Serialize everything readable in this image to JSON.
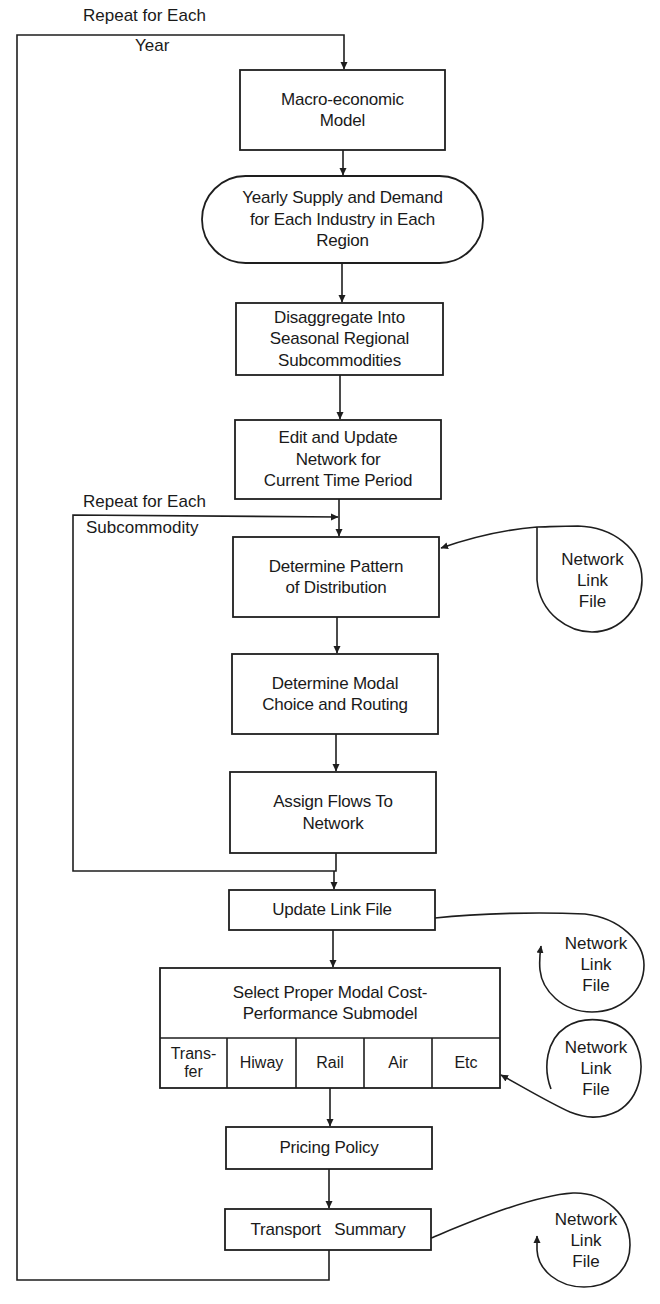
{
  "diagram": {
    "type": "flowchart",
    "loops": {
      "outer": {
        "line1": "Repeat for Each",
        "line2": "Year"
      },
      "inner": {
        "line1": "Repeat for Each",
        "line2": "Subcommodity"
      }
    },
    "nodes": [
      {
        "id": "macro_model",
        "shape": "process",
        "lines": [
          "Macro-economic",
          "Model"
        ]
      },
      {
        "id": "supply_demand",
        "shape": "terminal",
        "lines": [
          "Yearly Supply and Demand",
          "for Each Industry in Each",
          "Region"
        ]
      },
      {
        "id": "disaggregate",
        "shape": "process",
        "lines": [
          "Disaggregate Into",
          "Seasonal Regional",
          "Subcommodities"
        ]
      },
      {
        "id": "edit_network",
        "shape": "process",
        "lines": [
          "Edit and Update",
          "Network for",
          "Current Time Period"
        ]
      },
      {
        "id": "distribution_pattern",
        "shape": "process",
        "lines": [
          "Determine Pattern",
          "of Distribution"
        ]
      },
      {
        "id": "modal_choice",
        "shape": "process",
        "lines": [
          "Determine Modal",
          "Choice and Routing"
        ]
      },
      {
        "id": "assign_flows",
        "shape": "process",
        "lines": [
          "Assign Flows To",
          "Network"
        ]
      },
      {
        "id": "update_link_file",
        "shape": "process",
        "lines": [
          "Update Link File"
        ]
      },
      {
        "id": "select_submodel",
        "shape": "process",
        "lines": [
          "Select Proper Modal Cost-",
          "Performance Submodel"
        ],
        "cells": [
          {
            "lines": [
              "Trans-",
              "fer"
            ]
          },
          {
            "lines": [
              "Hiway"
            ]
          },
          {
            "lines": [
              "Rail"
            ]
          },
          {
            "lines": [
              "Air"
            ]
          },
          {
            "lines": [
              "Etc"
            ]
          }
        ]
      },
      {
        "id": "pricing_policy",
        "shape": "process",
        "lines": [
          "Pricing Policy"
        ]
      },
      {
        "id": "transport_summary",
        "shape": "process",
        "lines": [
          "Transport   Summary"
        ]
      }
    ],
    "storage": [
      {
        "id": "store_1",
        "lines": [
          "Network",
          "Link",
          "File"
        ],
        "connects_to": "distribution_pattern",
        "direction": "in"
      },
      {
        "id": "store_2",
        "lines": [
          "Network",
          "Link",
          "File"
        ],
        "connects_to": "update_link_file",
        "direction": "out"
      },
      {
        "id": "store_3",
        "lines": [
          "Network",
          "Link",
          "File"
        ],
        "connects_to": "select_submodel",
        "direction": "in"
      },
      {
        "id": "store_4",
        "lines": [
          "Network",
          "Link",
          "File"
        ],
        "connects_to": "transport_summary",
        "direction": "out"
      }
    ]
  }
}
